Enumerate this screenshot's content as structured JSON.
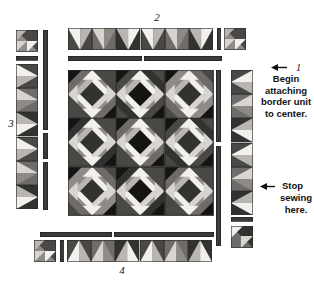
{
  "diagram": {
    "width": 314,
    "height": 289,
    "background": "#ffffff"
  },
  "labels": {
    "top_number": "2",
    "left_number": "3",
    "bottom_number": "4",
    "right_number": "1"
  },
  "annotations": [
    {
      "id": "begin-note",
      "number": "1",
      "lines": [
        "Begin",
        "attaching",
        "border unit",
        "to center."
      ],
      "arrow": "left"
    },
    {
      "id": "stop-note",
      "number": "",
      "lines": [
        "Stop",
        "sewing",
        "here."
      ],
      "arrow": "left"
    }
  ],
  "colors": {
    "white": "#f2f0ec",
    "light": "#d8d5d0",
    "lightgray": "#b9b6b1",
    "midgray": "#8e8b87",
    "gray": "#6e6b68",
    "darkgray": "#4a4845",
    "charcoal": "#323230",
    "black": "#151413",
    "outline": "#2b2b2b",
    "strip": "#3a3a3a",
    "text": "#111111"
  },
  "center": {
    "name": "quilt-center",
    "rows": 3,
    "cols": 3,
    "block_name": "star-block",
    "description": "3 by 3 grid of pieced star blocks, each built from a 4 by 4 arrangement of half-square triangles"
  },
  "borders": {
    "top": {
      "name": "top-border-unit",
      "geese_count": 6,
      "corner_squares": 1,
      "sashing_segments": 2,
      "label": "2"
    },
    "left": {
      "name": "left-border-unit",
      "geese_count": 6,
      "corner_squares": 1,
      "sashing_segments": 3,
      "label": "3"
    },
    "right": {
      "name": "right-border-unit",
      "geese_count": 6,
      "corner_squares": 1,
      "sashing_segments": 3,
      "label": "1"
    },
    "bottom": {
      "name": "bottom-border-unit",
      "geese_count": 6,
      "corner_squares": 1,
      "sashing_segments": 2,
      "label": "4"
    }
  }
}
